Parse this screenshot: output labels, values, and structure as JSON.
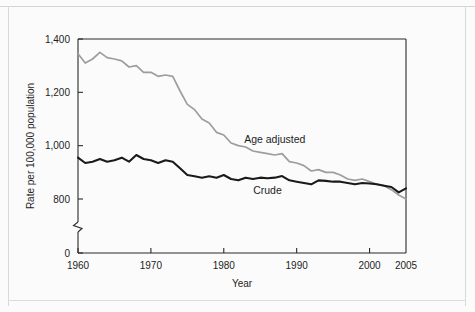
{
  "figure": {
    "background_color": "#fbfbfb",
    "border_color": "#d9d9d9"
  },
  "chart_data": {
    "type": "line",
    "title": "",
    "subtitle": "",
    "xlabel": "Year",
    "ylabel": "Rate per 100,000 population",
    "xlim": [
      1960,
      2005
    ],
    "ylim": [
      760,
      1400
    ],
    "y_axis_break": true,
    "y_break_label": "0",
    "grid": false,
    "legend_position": "inline-annotation",
    "x_ticks": [
      "1960",
      "1970",
      "1980",
      "1990",
      "2000",
      "2005"
    ],
    "x_tick_values": [
      1960,
      1970,
      1980,
      1990,
      2000,
      2005
    ],
    "y_ticks": [
      "0",
      "800",
      "1,000",
      "1,200",
      "1,400"
    ],
    "y_tick_values": [
      760,
      800,
      1000,
      1200,
      1400
    ],
    "x": [
      1960,
      1961,
      1962,
      1963,
      1964,
      1965,
      1966,
      1967,
      1968,
      1969,
      1970,
      1971,
      1972,
      1973,
      1974,
      1975,
      1976,
      1977,
      1978,
      1979,
      1980,
      1981,
      1982,
      1983,
      1984,
      1985,
      1986,
      1987,
      1988,
      1989,
      1990,
      1991,
      1992,
      1993,
      1994,
      1995,
      1996,
      1997,
      1998,
      1999,
      2000,
      2001,
      2002,
      2003,
      2004,
      2005
    ],
    "series": [
      {
        "name": "Age adjusted",
        "color": "#9d9d9d",
        "label_text": "Age adjusted",
        "values": [
          1345,
          1310,
          1325,
          1350,
          1330,
          1325,
          1318,
          1295,
          1300,
          1275,
          1275,
          1260,
          1265,
          1260,
          1205,
          1155,
          1135,
          1100,
          1085,
          1050,
          1040,
          1010,
          1000,
          995,
          980,
          975,
          970,
          965,
          970,
          940,
          935,
          925,
          905,
          910,
          900,
          900,
          890,
          875,
          870,
          875,
          865,
          855,
          850,
          835,
          815,
          800
        ]
      },
      {
        "name": "Crude",
        "color": "#1a1a1a",
        "label_text": "Crude",
        "values": [
          955,
          935,
          940,
          950,
          940,
          945,
          955,
          940,
          965,
          950,
          945,
          935,
          945,
          940,
          915,
          890,
          885,
          880,
          885,
          880,
          890,
          875,
          870,
          880,
          875,
          880,
          878,
          880,
          886,
          870,
          865,
          860,
          855,
          870,
          868,
          865,
          865,
          860,
          855,
          860,
          858,
          855,
          850,
          845,
          825,
          840
        ]
      }
    ],
    "annotations": [
      {
        "text": "Age adjusted",
        "x": 1987,
        "y": 1010
      },
      {
        "text": "Crude",
        "x": 1986,
        "y": 818
      }
    ]
  }
}
